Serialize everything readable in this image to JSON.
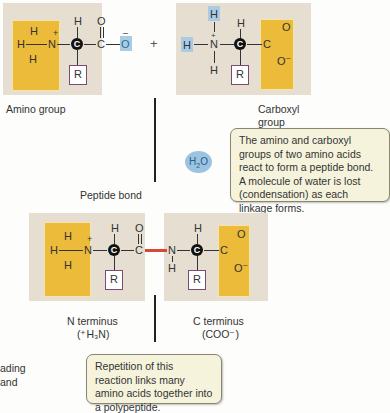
{
  "molecule1": {
    "atoms": {
      "h_top": "H",
      "h_left": "H",
      "h_bottom": "H",
      "n": "N",
      "n_charge": "+",
      "c_alpha": "C",
      "h_alpha": "H",
      "c_carbonyl": "C",
      "o_double": "O",
      "o_single": "O",
      "o_charge": "–",
      "r": "R"
    }
  },
  "plus_sign": "+",
  "molecule2": {
    "atoms": {
      "h_top": "H",
      "h_left": "H",
      "h_bottom": "H",
      "n": "N",
      "n_charge": "+",
      "c_alpha": "C",
      "h_alpha": "H",
      "c_carbonyl": "C",
      "o_double": "O",
      "o_single": "O",
      "o_charge": "–",
      "r": "R"
    }
  },
  "labels": {
    "amino_group": "Amino group",
    "carboxyl_group_line1": "Carboxyl",
    "carboxyl_group_line2": "group",
    "peptide_bond": "Peptide bond",
    "n_terminus": "N terminus",
    "n_terminus_formula": "(⁺H₃N)",
    "c_terminus": "C terminus",
    "c_terminus_formula": "(COO⁻)",
    "side_text_line1": "ading",
    "side_text_line2": "and"
  },
  "water": {
    "h": "H",
    "sub": "2",
    "o": "O"
  },
  "callouts": {
    "condensation": "The amino and carboxyl groups of two amino acids react to form a peptide bond. A molecule of water is lost (condensation) as each linkage forms.",
    "repetition": "Repetition of this reaction links many amino acids together into a polypeptide."
  },
  "dipeptide": {
    "left": {
      "h_top": "H",
      "h_left": "H",
      "h_bottom": "H",
      "n": "N",
      "n_charge": "+",
      "c_alpha": "C",
      "h_alpha": "H",
      "c_carbonyl": "C",
      "o_double": "O",
      "r": "R"
    },
    "right": {
      "n": "N",
      "h_n": "H",
      "c_alpha": "C",
      "h_alpha": "H",
      "c_carbonyl": "C",
      "o_double": "O",
      "o_single": "O",
      "o_charge": "–",
      "r": "R"
    }
  },
  "colors": {
    "panel": "#e6dfd1",
    "highlight_yellow": "#ecbb3a",
    "highlight_blue": "#a9cbe3",
    "peptide_bond_red": "#d9473a",
    "r_box_border": "#7a4a72",
    "callout_bg": "#f6f3dc"
  }
}
